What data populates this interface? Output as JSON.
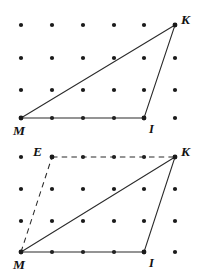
{
  "document": {
    "title": "Triangle MIK on dot grid — two figures",
    "background_color": "#ffffff",
    "line_color": "#2b2b2b",
    "dot_color": "#1a1a1a"
  },
  "figures": [
    {
      "id": "figure-top",
      "caption": "Triangle MIK drawn on a 6 by 4 dot grid",
      "grid": {
        "columns": 6,
        "rows": 4,
        "x_positions": [
          21,
          52,
          83,
          114,
          144,
          175
        ],
        "y_positions": [
          25,
          58,
          90,
          118
        ],
        "dot_radius": 2.1
      },
      "points": [
        {
          "name": "M",
          "label": "M",
          "x": 21,
          "y": 118,
          "label_x": 13,
          "label_y": 135,
          "marked": true
        },
        {
          "name": "I",
          "label": "I",
          "x": 144,
          "y": 118,
          "label_x": 149,
          "label_y": 133,
          "marked": true
        },
        {
          "name": "K",
          "label": "K",
          "x": 175,
          "y": 25,
          "label_x": 181,
          "label_y": 24,
          "marked": true
        }
      ],
      "solid_edges": [
        {
          "name": "edge-M-K",
          "from": "M",
          "to": "K"
        },
        {
          "name": "edge-K-I",
          "from": "K",
          "to": "I"
        },
        {
          "name": "edge-M-I",
          "from": "M",
          "to": "I"
        }
      ],
      "dashed_edges": []
    },
    {
      "id": "figure-bottom",
      "caption": "Triangle MIK with dashed construction lines through E",
      "grid": {
        "columns": 6,
        "rows": 4,
        "x_positions": [
          21,
          52,
          83,
          114,
          144,
          175
        ],
        "y_positions": [
          18,
          50,
          82,
          113
        ],
        "dot_radius": 2.1
      },
      "points": [
        {
          "name": "M",
          "label": "M",
          "x": 21,
          "y": 113,
          "label_x": 13,
          "label_y": 130,
          "marked": true
        },
        {
          "name": "I",
          "label": "I",
          "x": 144,
          "y": 113,
          "label_x": 149,
          "label_y": 128,
          "marked": true
        },
        {
          "name": "K",
          "label": "K",
          "x": 175,
          "y": 18,
          "label_x": 181,
          "label_y": 17,
          "marked": true
        },
        {
          "name": "E",
          "label": "E",
          "x": 52,
          "y": 18,
          "label_x": 33,
          "label_y": 17,
          "marked": true
        }
      ],
      "solid_edges": [
        {
          "name": "edge-M-K",
          "from": "M",
          "to": "K"
        },
        {
          "name": "edge-K-I",
          "from": "K",
          "to": "I"
        },
        {
          "name": "edge-M-I",
          "from": "M",
          "to": "I"
        }
      ],
      "dashed_edges": [
        {
          "name": "edge-E-K",
          "from": "E",
          "to": "K"
        },
        {
          "name": "edge-M-E",
          "from": "M",
          "to": "E"
        }
      ]
    }
  ]
}
